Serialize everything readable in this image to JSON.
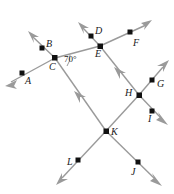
{
  "figure": {
    "type": "geometry-diagram",
    "width": 174,
    "height": 194,
    "background_color": "#ffffff",
    "line_color": "#9a9a9a",
    "point_color": "#111111",
    "label_color": "#1a1a1a",
    "angles": [
      {
        "id": "angle-c",
        "value": "70°",
        "at_point": "C",
        "x": 64,
        "y": 55
      }
    ],
    "intersections": [
      {
        "id": "C",
        "label": "C",
        "x": 55,
        "y": 58,
        "label_x": 49,
        "label_y": 62
      },
      {
        "id": "E",
        "label": "E",
        "x": 100,
        "y": 46,
        "label_x": 95,
        "label_y": 49
      },
      {
        "id": "H",
        "label": "H",
        "x": 139,
        "y": 95,
        "label_x": 125,
        "label_y": 88
      },
      {
        "id": "K",
        "label": "K",
        "x": 106,
        "y": 131,
        "label_x": 111,
        "label_y": 127
      }
    ],
    "ray_points": [
      {
        "id": "A",
        "label": "A",
        "x": 22,
        "y": 73,
        "label_x": 25,
        "label_y": 76
      },
      {
        "id": "B",
        "label": "B",
        "x": 42,
        "y": 48,
        "label_x": 46,
        "label_y": 39
      },
      {
        "id": "D",
        "label": "D",
        "x": 91,
        "y": 36,
        "label_x": 95,
        "label_y": 26
      },
      {
        "id": "F",
        "label": "F",
        "x": 130,
        "y": 32,
        "label_x": 133,
        "label_y": 38
      },
      {
        "id": "G",
        "label": "G",
        "x": 152,
        "y": 80,
        "label_x": 157,
        "label_y": 79
      },
      {
        "id": "I",
        "label": "I",
        "x": 152,
        "y": 111,
        "label_x": 148,
        "label_y": 114
      },
      {
        "id": "J",
        "label": "J",
        "x": 138,
        "y": 162,
        "label_x": 131,
        "label_y": 167
      },
      {
        "id": "L",
        "label": "L",
        "x": 78,
        "y": 160,
        "label_x": 67,
        "label_y": 157
      }
    ],
    "segments": [
      {
        "id": "seg-c-e",
        "from": "C",
        "to": "E"
      },
      {
        "id": "seg-c-k",
        "from": "C",
        "to": "K"
      },
      {
        "id": "seg-e-h",
        "from": "E",
        "to": "H"
      },
      {
        "id": "seg-h-k",
        "from": "H",
        "to": "K"
      }
    ],
    "rays": [
      {
        "id": "ray-c-a",
        "from": "C",
        "through": "A",
        "tip_x": 6,
        "tip_y": 85,
        "arrow": true
      },
      {
        "id": "ray-c-b",
        "from": "C",
        "through": "B",
        "tip_x": 29,
        "tip_y": 33,
        "arrow": true
      },
      {
        "id": "ray-e-d",
        "from": "E",
        "through": "D",
        "tip_x": 79,
        "tip_y": 24,
        "arrow": true
      },
      {
        "id": "ray-e-f",
        "from": "E",
        "through": "F",
        "tip_x": 150,
        "tip_y": 22,
        "arrow": true
      },
      {
        "id": "ray-h-g",
        "from": "H",
        "through": "G",
        "tip_x": 167,
        "tip_y": 62,
        "arrow": true
      },
      {
        "id": "ray-h-i",
        "from": "H",
        "through": "I",
        "tip_x": 166,
        "tip_y": 122,
        "arrow": true
      },
      {
        "id": "ray-k-l",
        "from": "K",
        "through": "L",
        "tip_x": 57,
        "tip_y": 183,
        "arrow": true
      },
      {
        "id": "ray-k-j",
        "from": "K",
        "through": "J",
        "tip_x": 160,
        "tip_y": 184,
        "arrow": true
      }
    ],
    "mid_arrows": [
      {
        "id": "midarrow-c-k",
        "x": 79,
        "y": 96,
        "rotation": 235
      },
      {
        "id": "midarrow-h-e",
        "x": 120,
        "y": 71,
        "rotation": 228
      }
    ]
  }
}
